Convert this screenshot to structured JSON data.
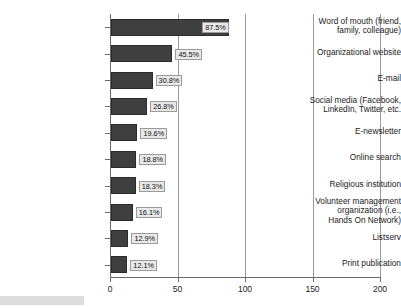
{
  "chart_data": {
    "type": "bar",
    "orientation": "horizontal",
    "title": "",
    "xlabel": "",
    "ylabel": "",
    "xlim": [
      0,
      200
    ],
    "xticks": [
      0,
      50,
      100,
      150,
      200
    ],
    "grid": true,
    "legend": false,
    "value_suffix": "%",
    "bar_color": "#3f3f3f",
    "categories": [
      "Word of mouth (friend,\nfamily, colleague)",
      "Organizational website",
      "E-mail",
      "Social media (Facebook,\nLinkedIn, Twitter, etc.",
      "E-newsletter",
      "Online search",
      "Religious institution",
      "Volunteer management\norganization (i.e.,\nHands On Network)",
      "Listserv",
      "Print publication"
    ],
    "values": [
      87.5,
      45.5,
      30.8,
      26.8,
      19.6,
      18.8,
      18.3,
      16.1,
      12.9,
      12.1
    ],
    "value_labels": [
      "87.5%",
      "45.5%",
      "30.8%",
      "26.8%",
      "19.6%",
      "18.8%",
      "18.3%",
      "16.1%",
      "12.9%",
      "12.1%"
    ]
  }
}
